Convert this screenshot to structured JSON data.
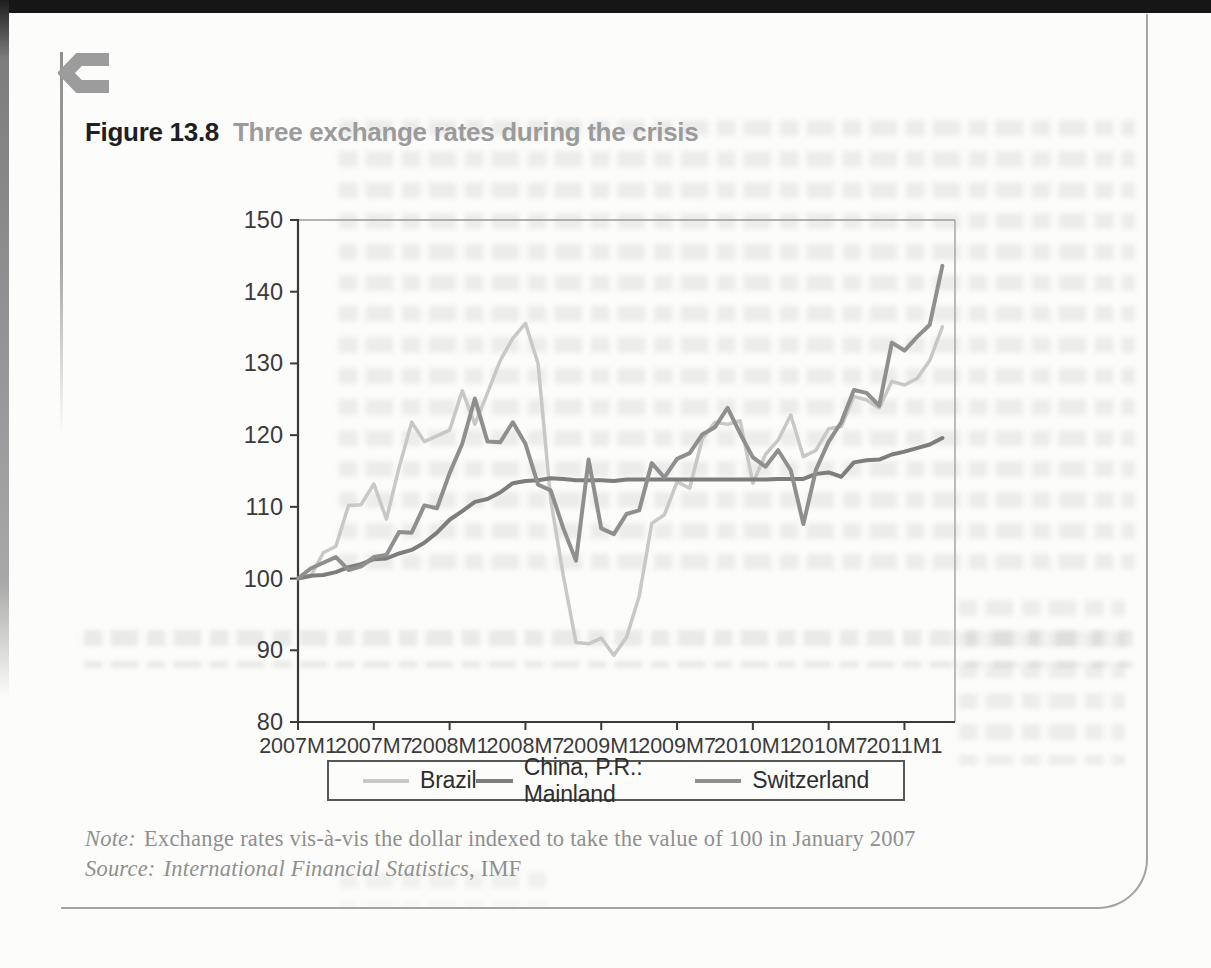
{
  "page": {
    "figure_label": "Figure 13.8",
    "figure_title": "Three exchange rates during the crisis",
    "note_label": "Note:",
    "note_text": "Exchange rates vis-à-vis the dollar indexed to take the value of 100 in January 2007",
    "source_label": "Source:",
    "source_name": "International Financial Statistics",
    "source_suffix": ", IMF"
  },
  "icons": {
    "corner_glyph": "c-arrow-glyph"
  },
  "colors": {
    "brazil_line": "#c7c9c6",
    "china_line": "#7d7d7d",
    "switzerland_line": "#8f8f8f",
    "axis": "#3a3a3a",
    "frame_light": "#ababab",
    "caption_label": "#1f1f1f",
    "caption_title": "#9b9b9b",
    "note_text": "#8f8f8f",
    "legend_border": "#565656"
  },
  "chart_data": {
    "type": "line",
    "title": "Three exchange rates during the crisis",
    "grid": false,
    "legend_position": "bottom",
    "ylim": [
      80,
      150
    ],
    "y_ticks": [
      80,
      90,
      100,
      110,
      120,
      130,
      140,
      150
    ],
    "x_tick_labels": [
      "2007M1",
      "2007M7",
      "2008M1",
      "2008M7",
      "2009M1",
      "2009M7",
      "2010M1",
      "2010M7",
      "2011M1"
    ],
    "x_tick_month_indices": [
      0,
      6,
      12,
      18,
      24,
      30,
      36,
      42,
      48
    ],
    "xlabel": "",
    "ylabel": "",
    "months": [
      "2007M1",
      "2007M2",
      "2007M3",
      "2007M4",
      "2007M5",
      "2007M6",
      "2007M7",
      "2007M8",
      "2007M9",
      "2007M10",
      "2007M11",
      "2007M12",
      "2008M1",
      "2008M2",
      "2008M3",
      "2008M4",
      "2008M5",
      "2008M6",
      "2008M7",
      "2008M8",
      "2008M9",
      "2008M10",
      "2008M11",
      "2008M12",
      "2009M1",
      "2009M2",
      "2009M3",
      "2009M4",
      "2009M5",
      "2009M6",
      "2009M7",
      "2009M8",
      "2009M9",
      "2009M10",
      "2009M11",
      "2009M12",
      "2010M1",
      "2010M2",
      "2010M3",
      "2010M4",
      "2010M5",
      "2010M6",
      "2010M7",
      "2010M8",
      "2010M9",
      "2010M10",
      "2010M11",
      "2010M12",
      "2011M1",
      "2011M2",
      "2011M3",
      "2011M4"
    ],
    "series": [
      {
        "name": "Brazil",
        "color": "#c7c9c6",
        "stroke_width": 3.5,
        "values": [
          100,
          100.3,
          103.6,
          104.5,
          110.2,
          110.3,
          113.2,
          108.3,
          115.5,
          121.8,
          119.1,
          119.9,
          120.7,
          126.2,
          121.5,
          125.9,
          130.4,
          133.5,
          135.6,
          130.0,
          111.0,
          100.4,
          91.1,
          90.9,
          91.7,
          89.3,
          91.8,
          97.5,
          107.7,
          108.9,
          113.5,
          112.6,
          119.5,
          121.8,
          121.5,
          122.0,
          113.3,
          117.3,
          119.3,
          122.8,
          117.0,
          117.9,
          120.9,
          121.2,
          125.4,
          124.9,
          123.8,
          127.5,
          127.0,
          127.9,
          130.4,
          135.1
        ]
      },
      {
        "name": "China, P.R.: Mainland",
        "color": "#7d7d7d",
        "stroke_width": 4,
        "values": [
          100,
          100.4,
          100.5,
          100.9,
          101.6,
          102.0,
          102.7,
          102.8,
          103.5,
          104.0,
          105.0,
          106.4,
          108.2,
          109.4,
          110.7,
          111.1,
          112.0,
          113.3,
          113.6,
          113.7,
          114.0,
          113.9,
          113.7,
          113.7,
          113.7,
          113.6,
          113.8,
          113.8,
          113.8,
          113.8,
          113.8,
          113.8,
          113.8,
          113.8,
          113.8,
          113.8,
          113.8,
          113.8,
          113.9,
          113.9,
          113.9,
          114.6,
          114.8,
          114.2,
          116.2,
          116.5,
          116.6,
          117.3,
          117.7,
          118.2,
          118.7,
          119.6
        ]
      },
      {
        "name": "Switzerland",
        "color": "#8f8f8f",
        "stroke_width": 4,
        "values": [
          100,
          101.4,
          102.2,
          103.0,
          101.2,
          101.7,
          103.0,
          103.3,
          106.5,
          106.4,
          110.2,
          109.8,
          114.7,
          118.8,
          125.1,
          119.1,
          119.0,
          121.8,
          118.8,
          113.1,
          112.3,
          107.0,
          102.5,
          116.6,
          107.0,
          106.2,
          109.0,
          109.5,
          116.1,
          114.1,
          116.7,
          117.5,
          120.1,
          121.1,
          123.8,
          120.2,
          116.9,
          115.6,
          117.9,
          115.1,
          107.6,
          115.2,
          119.1,
          121.8,
          126.3,
          125.9,
          124.1,
          132.9,
          131.8,
          133.7,
          135.4,
          143.6
        ]
      }
    ]
  }
}
